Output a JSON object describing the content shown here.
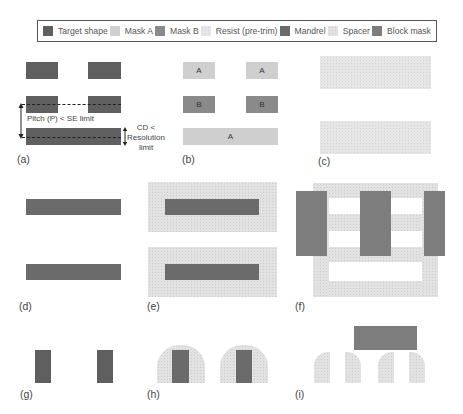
{
  "legend": {
    "items": [
      {
        "key": "target",
        "label": "Target shape",
        "color": "#5f5f5f"
      },
      {
        "key": "maskA",
        "label": "Mask A",
        "color": "#cfcfcf"
      },
      {
        "key": "maskB",
        "label": "Mask B",
        "color": "#8a8a8a"
      },
      {
        "key": "resist",
        "label": "Resist (pre-trim)",
        "color": "#e6e6e6"
      },
      {
        "key": "mandrel",
        "label": "Mandrel",
        "color": "#6b6b6b"
      },
      {
        "key": "spacer",
        "label": "Spacer",
        "color": "#e2e2e2"
      },
      {
        "key": "block",
        "label": "Block mask",
        "color": "#7d7d7d"
      }
    ]
  },
  "panels": {
    "a": {
      "label": "(a)",
      "pitch_note": "Pitch (P) < SE limit",
      "cd_note_1": "CD <",
      "cd_note_2": "Resolution",
      "cd_note_3": "limit"
    },
    "b": {
      "label": "(b)",
      "letters": [
        "A",
        "A",
        "B",
        "B",
        "A"
      ]
    },
    "c": {
      "label": "(c)"
    },
    "d": {
      "label": "(d)"
    },
    "e": {
      "label": "(e)"
    },
    "f": {
      "label": "(f)"
    },
    "g": {
      "label": "(g)"
    },
    "h": {
      "label": "(h)"
    },
    "i": {
      "label": "(i)"
    }
  }
}
